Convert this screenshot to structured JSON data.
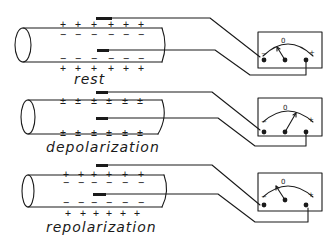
{
  "diagram": {
    "type": "nerve-membrane-potential",
    "panels": [
      {
        "id": "rest",
        "label": "rest",
        "outer_top_signs": [
          "+",
          "+",
          "+",
          "+",
          "+",
          "+"
        ],
        "inner_top_signs": [
          "−",
          "−",
          "−",
          "−",
          "−",
          "−"
        ],
        "inner_bottom_signs": [
          "−",
          "−",
          "−",
          "−",
          "−",
          "−"
        ],
        "outer_bottom_signs": [
          "+",
          "+",
          "+",
          "+",
          "+",
          "+"
        ],
        "meter": {
          "minus_label": "−",
          "zero_label": "0",
          "plus_label": "+",
          "needle": "left-of-zero"
        }
      },
      {
        "id": "depolarization",
        "label": "depolarization",
        "outer_top_signs": [
          "±",
          "±",
          "±",
          "±",
          "±",
          "±"
        ],
        "inner_top_signs": [
          "±",
          "±",
          "±",
          "±",
          "±",
          "±"
        ],
        "inner_bottom_signs": [
          "±",
          "±",
          "±",
          "±",
          "±",
          "±"
        ],
        "outer_bottom_signs": [
          "±",
          "±",
          "±",
          "±",
          "±",
          "±"
        ],
        "meter": {
          "minus_label": "−",
          "zero_label": "0",
          "plus_label": "+",
          "needle": "right-of-zero"
        }
      },
      {
        "id": "repolarization",
        "label": "repolarization",
        "outer_top_signs": [
          "+",
          "+",
          "+",
          "+",
          "+",
          "+"
        ],
        "inner_top_signs": [
          "−",
          "−",
          "−",
          "−",
          "−",
          "−"
        ],
        "inner_bottom_signs": [
          "−",
          "−",
          "−",
          "−",
          "−",
          "−"
        ],
        "outer_bottom_signs": [
          "+",
          "+",
          "+",
          "+",
          "+",
          "+"
        ],
        "meter": {
          "minus_label": "−",
          "zero_label": "0",
          "plus_label": "+",
          "needle": "left-of-zero"
        }
      }
    ],
    "colors": {
      "ink": "#1a1a1a",
      "background": "#ffffff"
    }
  }
}
